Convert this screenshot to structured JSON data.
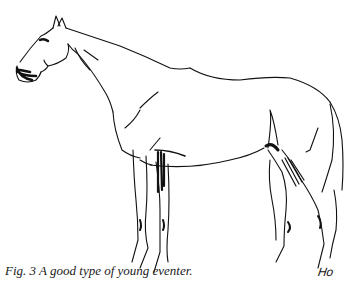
{
  "figure": {
    "caption": "Fig. 3  A good type of young eventer.",
    "signature": "Ho",
    "ink_color": "#111111",
    "paper_color": "#ffffff"
  }
}
